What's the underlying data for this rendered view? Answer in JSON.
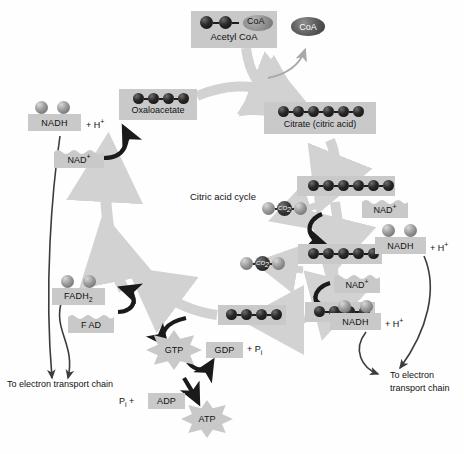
{
  "diagram": {
    "title": "Citric acid cycle",
    "center_label": "Citric acid cycle",
    "type": "metabolic-pathway"
  },
  "molecules": {
    "acetyl_coa": {
      "label": "Acetyl CoA",
      "coa_tag": "CoA",
      "carbons": 2
    },
    "coa_released": {
      "label": "CoA"
    },
    "oxaloacetate": {
      "label": "Oxaloacetate",
      "carbons": 4
    },
    "citrate": {
      "label": "Citrate (citric acid)",
      "carbons": 6
    },
    "six_carbon": {
      "label": "",
      "carbons": 6
    },
    "five_carbon": {
      "label": "",
      "carbons": 5
    },
    "four_carbon_right": {
      "label": "",
      "carbons": 4
    },
    "four_carbon_bottom": {
      "label": "",
      "carbons": 4
    }
  },
  "cofactors": {
    "nadh_top": {
      "label": "NADH",
      "plus_h": "+ H",
      "plus_h_sup": "+",
      "electrons": 2
    },
    "nad_top": {
      "label": "NAD",
      "charge": "+"
    },
    "nad_right_upper": {
      "label": "NAD",
      "charge": "+"
    },
    "nadh_right_upper": {
      "label": "NADH",
      "plus_h": "+ H",
      "plus_h_sup": "+",
      "electrons": 2
    },
    "nad_right_lower": {
      "label": "NAD",
      "charge": "+"
    },
    "nadh_right_lower": {
      "label": "NADH",
      "plus_h": "+ H",
      "plus_h_sup": "+",
      "electrons": 2
    },
    "fadh2": {
      "label": "FADH",
      "subscript": "2",
      "electrons": 2
    },
    "fad": {
      "label": "F AD"
    }
  },
  "byproducts": {
    "co2_upper": {
      "label": "CO",
      "subscript": "2"
    },
    "co2_lower": {
      "label": "CO",
      "subscript": "2"
    }
  },
  "energy": {
    "gtp": {
      "label": "GTP"
    },
    "gdp": {
      "label": "GDP"
    },
    "gdp_pi": {
      "text": "+ P",
      "sub": "i"
    },
    "adp": {
      "label": "ADP"
    },
    "pi_adp": {
      "text": "P",
      "sub": "i",
      "plus": " +"
    },
    "atp": {
      "label": "ATP"
    }
  },
  "annotations": {
    "etc_left": "To electron transport chain",
    "etc_right_line1": "To electron",
    "etc_right_line2": "transport chain"
  },
  "colors": {
    "box_gray": "#c9c9c9",
    "cycle_arrow_gray": "#d2d2d2",
    "black_arrow": "#1a1a1a",
    "sphere_dark": "#1d1d1d",
    "sphere_light": "#9b9b9b",
    "text": "#111111",
    "page_bg": "#ffffff"
  }
}
